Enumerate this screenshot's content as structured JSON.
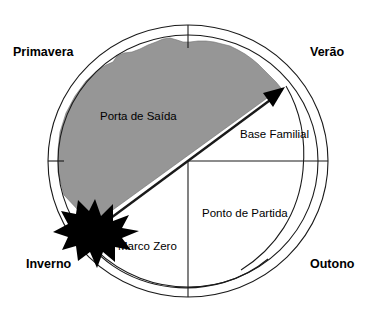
{
  "diagram": {
    "type": "circular-quadrant-diagram",
    "colors": {
      "background": "#ffffff",
      "region_fill": "#969696",
      "stroke": "#1a1a1a",
      "starburst_fill": "#000000",
      "text": "#000000"
    },
    "season_labels": [
      {
        "key": "primavera",
        "text": "Primavera",
        "position": "top-left",
        "x": 13,
        "y": 56
      },
      {
        "key": "verao",
        "text": "Verão",
        "position": "top-right",
        "x": 310,
        "y": 56
      },
      {
        "key": "inverno",
        "text": "Inverno",
        "position": "bottom-left",
        "x": 26,
        "y": 268
      },
      {
        "key": "outono",
        "text": "Outono",
        "position": "bottom-right",
        "x": 310,
        "y": 268
      }
    ],
    "inner_labels": [
      {
        "key": "porta-de-saida",
        "text": "Porta de Saída",
        "x": 100,
        "y": 120
      },
      {
        "key": "base-familial",
        "text": "Base Familial",
        "x": 240,
        "y": 138
      },
      {
        "key": "ponto-de-partida",
        "text": "Ponto de Partida",
        "x": 202,
        "y": 217
      },
      {
        "key": "marco-zero",
        "text": "Marco Zero",
        "x": 118,
        "y": 250
      }
    ],
    "geometry": {
      "center_x": 188,
      "center_y": 161,
      "outer_radius": 140,
      "inner_radius": 130,
      "starburst_center_x": 95,
      "starburst_center_y": 228,
      "starburst_points": 12,
      "arrow_tip_x": 284,
      "arrow_tip_y": 88
    }
  }
}
